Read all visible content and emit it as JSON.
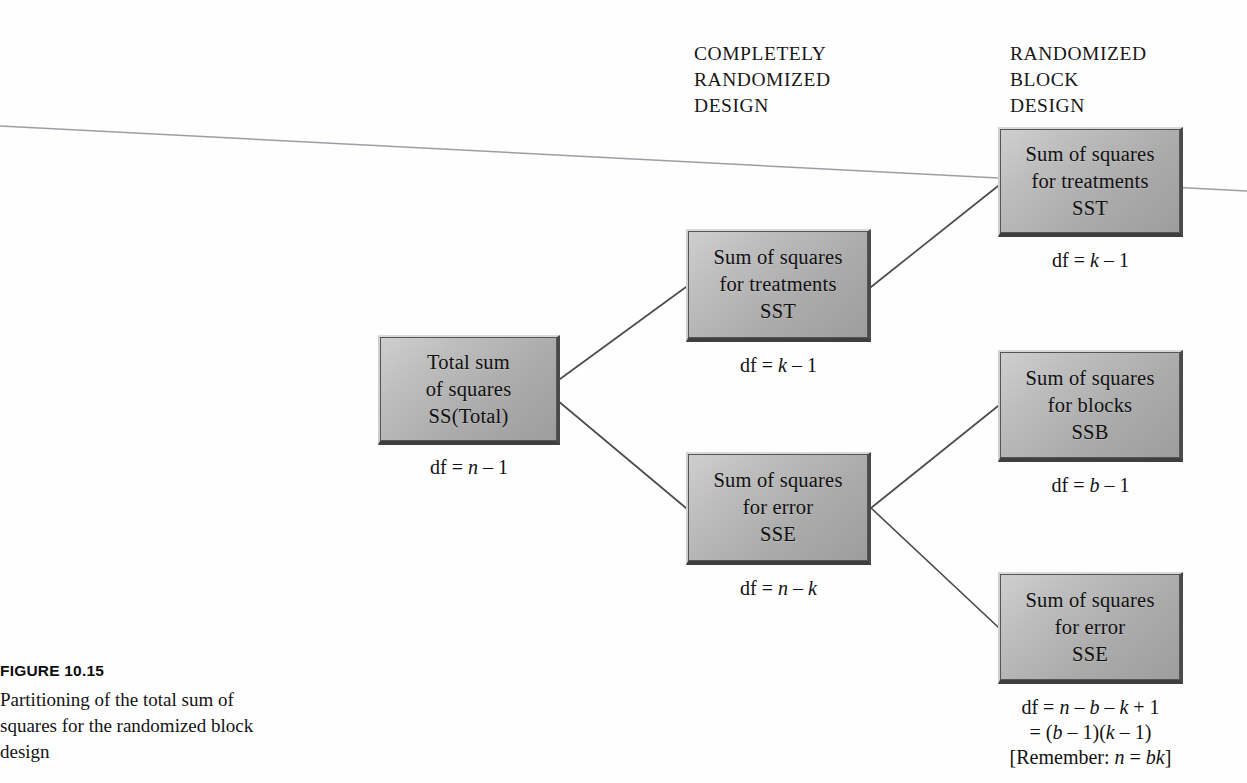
{
  "figure": {
    "number": "FIGURE 10.15",
    "caption": "Partitioning of the total sum of squares for the randomized block design"
  },
  "headings": {
    "completely_randomized": "COMPLETELY\nRANDOMIZED\nDESIGN",
    "randomized_block": "RANDOMIZED\nBLOCK\nDESIGN"
  },
  "nodes": {
    "total": {
      "label": "Total sum\nof squares\nSS(Total)",
      "df": "df = n – 1"
    },
    "crd_sst": {
      "label": "Sum of squares\nfor treatments\nSST",
      "df": "df = k – 1"
    },
    "crd_sse": {
      "label": "Sum of squares\nfor error\nSSE",
      "df": "df = n – k"
    },
    "rbd_sst": {
      "label": "Sum of squares\nfor treatments\nSST",
      "df": "df = k – 1"
    },
    "rbd_ssb": {
      "label": "Sum of squares\nfor blocks\nSSB",
      "df": "df = b – 1"
    },
    "rbd_sse": {
      "label": "Sum of squares\nfor error\nSSE",
      "df": "df = n – b – k + 1\n= (b – 1)(k – 1)\n[Remember: n = bk]"
    }
  },
  "colors": {
    "box_fill_light": "#cfcfcf",
    "box_fill_dark": "#9d9d9d",
    "box_shadow": "#3f3f3f",
    "connector": "#4c4c4c",
    "text": "#111111",
    "page_background": "#fefefe"
  }
}
